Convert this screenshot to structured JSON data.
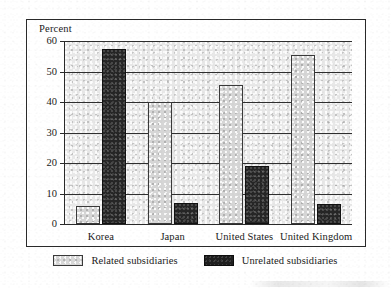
{
  "chart_data": {
    "type": "bar",
    "title": "",
    "subtitle": "",
    "xlabel": "",
    "ylabel": "Percent",
    "ylim": [
      0,
      60
    ],
    "yticks": [
      0,
      10,
      20,
      30,
      40,
      50,
      60
    ],
    "ytick_labels": [
      "0",
      "10",
      "20",
      "30",
      "40",
      "50",
      "60"
    ],
    "grid": true,
    "grid_axis": "y",
    "legend_position": "bottom",
    "categories": [
      "Korea",
      "Japan",
      "United States",
      "United Kingdom"
    ],
    "series": [
      {
        "name": "Related subsidiaries",
        "color": "#d6d6d6",
        "values": [
          6,
          40,
          45.5,
          55.5
        ]
      },
      {
        "name": "Unrelated subsidiaries",
        "color": "#262626",
        "values": [
          57.5,
          7,
          19,
          6.5
        ]
      }
    ]
  },
  "axis": {
    "y_title": "Percent"
  },
  "legend": {
    "items": [
      {
        "label": "Related subsidiaries",
        "swatch": "light-gray-swatch"
      },
      {
        "label": "Unrelated subsidiaries",
        "swatch": "dark-swatch"
      }
    ]
  }
}
